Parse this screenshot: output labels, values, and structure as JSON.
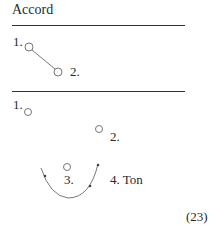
{
  "title": "Accord",
  "figure1": {
    "labels": [
      "1.",
      "2."
    ]
  },
  "figure2": {
    "labels": [
      "1.",
      "2.",
      "3.",
      "4. Ton"
    ]
  },
  "figure_number": "(23)"
}
